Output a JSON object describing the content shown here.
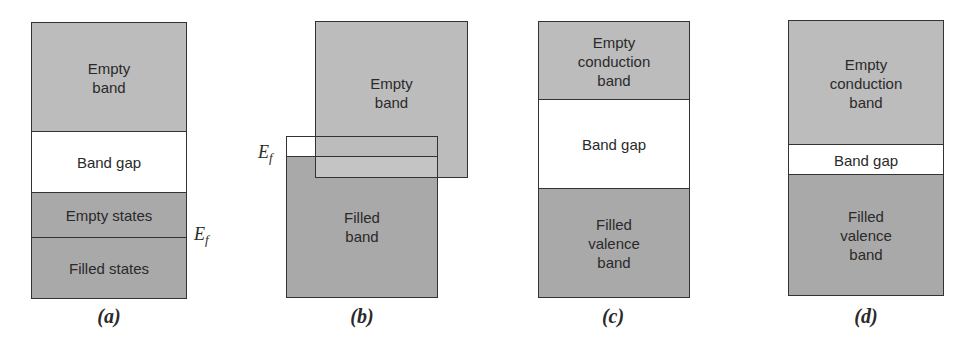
{
  "panels": {
    "a": {
      "caption": "(a)",
      "bands": {
        "empty_band": "Empty\nband",
        "band_gap": "Band gap",
        "empty_states": "Empty states",
        "filled_states": "Filled states"
      },
      "fermi_label": "E",
      "fermi_sub": "f"
    },
    "b": {
      "caption": "(b)",
      "bands": {
        "empty_band": "Empty\nband",
        "filled_band": "Filled\nband"
      },
      "fermi_label": "E",
      "fermi_sub": "f"
    },
    "c": {
      "caption": "(c)",
      "bands": {
        "conduction": "Empty\nconduction\nband",
        "band_gap": "Band gap",
        "valence": "Filled\nvalence\nband"
      }
    },
    "d": {
      "caption": "(d)",
      "bands": {
        "conduction": "Empty\nconduction\nband",
        "band_gap": "Band gap",
        "valence": "Filled\nvalence\nband"
      }
    }
  },
  "colors": {
    "empty_gray": "#bcbcbc",
    "filled_gray": "#a9a9a9",
    "gap_white": "#ffffff",
    "outline": "#333333"
  }
}
